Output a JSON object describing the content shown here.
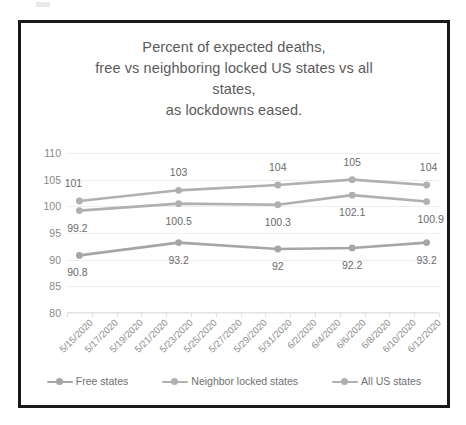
{
  "chart_data": {
    "type": "line",
    "title": "Percent of expected deaths, free vs neighboring locked US states vs all states, as lockdowns eased.",
    "title_lines": [
      "Percent of expected deaths,",
      "free vs neighboring locked US states vs all",
      "states,",
      "as lockdowns eased."
    ],
    "xlabel": "",
    "ylabel": "",
    "ylim": [
      80,
      110
    ],
    "yticks": [
      80,
      85,
      90,
      95,
      100,
      105,
      110
    ],
    "grid": true,
    "legend_position": "bottom",
    "categories": [
      "5/15/2020",
      "5/17/2020",
      "5/19/2020",
      "5/21/2020",
      "5/23/2020",
      "5/25/2020",
      "5/27/2020",
      "5/29/2020",
      "5/31/2020",
      "6/2/2020",
      "6/4/2020",
      "6/6/2020",
      "6/8/2020",
      "6/10/2020",
      "6/12/2020"
    ],
    "marker_categories": [
      "5/15/2020",
      "5/23/2020",
      "5/31/2020",
      "6/6/2020",
      "6/12/2020"
    ],
    "series": [
      {
        "name": "Free states",
        "color": "#a6a6a6",
        "x": [
          "5/15/2020",
          "5/23/2020",
          "5/31/2020",
          "6/6/2020",
          "6/12/2020"
        ],
        "values": [
          90.8,
          93.2,
          92,
          92.2,
          93.2
        ],
        "labels": [
          "90.8",
          "93.2",
          "92",
          "92.2",
          "93.2"
        ]
      },
      {
        "name": "Neighbor locked states",
        "color": "#b0b0b0",
        "x": [
          "5/15/2020",
          "5/23/2020",
          "5/31/2020",
          "6/6/2020",
          "6/12/2020"
        ],
        "values": [
          101,
          103,
          104,
          105,
          104
        ],
        "labels": [
          "101",
          "103",
          "104",
          "105",
          "104"
        ]
      },
      {
        "name": "All US states",
        "color": "#b0b0b0",
        "x": [
          "5/15/2020",
          "5/23/2020",
          "5/31/2020",
          "6/6/2020",
          "6/12/2020"
        ],
        "values": [
          99.2,
          100.5,
          100.3,
          102.1,
          100.9
        ],
        "labels": [
          "99.2",
          "100.5",
          "100.3",
          "102.1",
          "100.9"
        ]
      }
    ]
  },
  "style": {
    "frame_color": "#181818",
    "background": "#ffffff",
    "axis_text_color": "#888888",
    "title_color": "#5a5a5a",
    "gridline_color": "#eceded"
  }
}
